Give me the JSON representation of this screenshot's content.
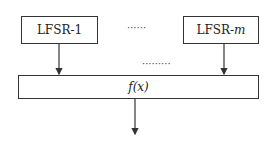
{
  "diagram": {
    "nodes": [
      {
        "id": "lfsr1",
        "label_main": "LFSR-",
        "label_sub": "1"
      },
      {
        "id": "lfsrm",
        "label_main": "LFSR-",
        "label_sub": "m"
      },
      {
        "id": "fx",
        "label": "f(x)"
      }
    ],
    "ellipsis_top": "······",
    "ellipsis_mid": "·········",
    "edges": [
      {
        "from": "lfsr1",
        "to": "fx"
      },
      {
        "from": "lfsrm",
        "to": "fx"
      },
      {
        "from": "fx",
        "to": "output"
      }
    ]
  }
}
